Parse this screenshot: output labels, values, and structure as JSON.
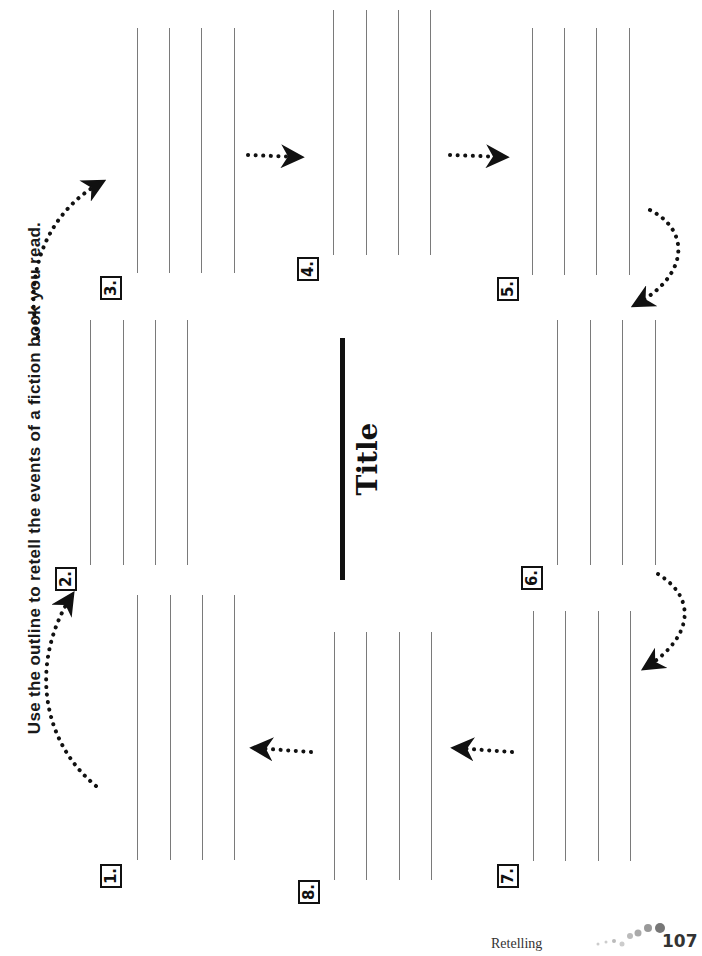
{
  "instructions": "Use the outline to retell the events of a fiction book you read.",
  "title_label": "Title",
  "boxes": [
    {
      "number": "1."
    },
    {
      "number": "2."
    },
    {
      "number": "3."
    },
    {
      "number": "4."
    },
    {
      "number": "5."
    },
    {
      "number": "6."
    },
    {
      "number": "7."
    },
    {
      "number": "8."
    }
  ],
  "footer": {
    "section": "Retelling",
    "page_number": "107"
  }
}
